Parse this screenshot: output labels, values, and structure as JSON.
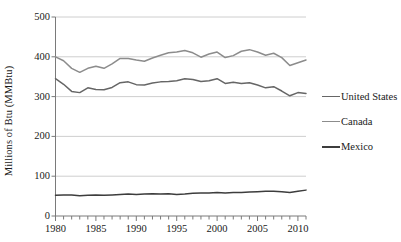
{
  "chart_data": {
    "type": "line",
    "title": "",
    "xlabel": "",
    "ylabel": "Millions of Btu (MMBtu)",
    "xlim": [
      1980,
      2011
    ],
    "ylim": [
      0,
      500
    ],
    "yticks": [
      0,
      100,
      200,
      300,
      400,
      500
    ],
    "ytick_labels": [
      "0",
      "100",
      "200",
      "300",
      "400",
      "500"
    ],
    "xticks": [
      1980,
      1985,
      1990,
      1995,
      2000,
      2005,
      2010
    ],
    "xtick_labels": [
      "1980",
      "1985",
      "1990",
      "1995",
      "2000",
      "2005",
      "2010"
    ],
    "x_minor_tick_interval": 1,
    "grid": "horizontal",
    "legend_position": "right",
    "x": [
      1980,
      1981,
      1982,
      1983,
      1984,
      1985,
      1986,
      1987,
      1988,
      1989,
      1990,
      1991,
      1992,
      1993,
      1994,
      1995,
      1996,
      1997,
      1998,
      1999,
      2000,
      2001,
      2002,
      2003,
      2004,
      2005,
      2006,
      2007,
      2008,
      2009,
      2010,
      2011
    ],
    "series": [
      {
        "name": "United States",
        "color": "#666666",
        "values": [
          345,
          331,
          313,
          310,
          322,
          318,
          317,
          323,
          335,
          337,
          330,
          329,
          334,
          337,
          338,
          340,
          345,
          343,
          338,
          340,
          345,
          333,
          336,
          333,
          335,
          329,
          322,
          325,
          314,
          302,
          310,
          308
        ]
      },
      {
        "name": "Canada",
        "color": "#8c8c8c",
        "values": [
          400,
          390,
          371,
          361,
          371,
          376,
          371,
          382,
          396,
          396,
          392,
          389,
          397,
          404,
          410,
          412,
          416,
          410,
          399,
          407,
          412,
          398,
          403,
          414,
          418,
          412,
          404,
          409,
          398,
          378,
          385,
          392
        ]
      },
      {
        "name": "Mexico",
        "color": "#3d3d3d",
        "values": [
          52,
          53,
          53,
          51,
          52,
          53,
          52,
          53,
          54,
          55,
          54,
          55,
          56,
          55,
          56,
          54,
          55,
          57,
          58,
          58,
          59,
          58,
          59,
          59,
          60,
          61,
          62,
          62,
          61,
          59,
          62,
          65
        ]
      }
    ]
  },
  "legend": {
    "items": [
      {
        "label": "United States"
      },
      {
        "label": "Canada"
      },
      {
        "label": "Mexico"
      }
    ]
  }
}
